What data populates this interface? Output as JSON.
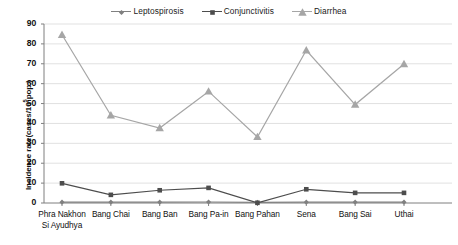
{
  "chart_data": {
    "type": "line",
    "title": "",
    "xlabel": "",
    "ylabel": "Incidence rate(cases/10⁵pop.)",
    "ylim": [
      0,
      90
    ],
    "ytick_step": 10,
    "yticks": [
      "0",
      "10",
      "20",
      "30",
      "40",
      "50",
      "60",
      "70",
      "80",
      "90"
    ],
    "grid": true,
    "legend_position": "top-center",
    "categories": [
      "Phra Nakhon Si Ayudhya",
      "Bang Chai",
      "Bang Ban",
      "Bang Pa-in",
      "Bang Pahan",
      "Sena",
      "Bang Sai",
      "Uthai"
    ],
    "category_lines": [
      [
        "Phra Nakhon",
        "Si Ayudhya"
      ],
      [
        "Bang Chai"
      ],
      [
        "Bang Ban"
      ],
      [
        "Bang Pa-in"
      ],
      [
        "Bang Pahan"
      ],
      [
        "Sena"
      ],
      [
        "Bang Sai"
      ],
      [
        "Uthai"
      ]
    ],
    "series": [
      {
        "name": "Leptospirosis",
        "marker": "diamond",
        "color": "#808080",
        "values": [
          0.4,
          0.4,
          0.4,
          0.5,
          0.3,
          0.4,
          0.4,
          0.4
        ]
      },
      {
        "name": "Conjunctivitis",
        "marker": "square",
        "color": "#4d4d4d",
        "values": [
          9.9,
          4.1,
          6.4,
          7.6,
          0.1,
          6.9,
          5.1,
          5.1
        ]
      },
      {
        "name": "Diarrhea",
        "marker": "triangle",
        "color": "#a6a6a6",
        "values": [
          84.6,
          44.1,
          37.7,
          56.1,
          33.2,
          76.8,
          49.5,
          69.9
        ]
      }
    ]
  },
  "legend": {
    "items": [
      {
        "label": "Leptospirosis"
      },
      {
        "label": "Conjunctivitis"
      },
      {
        "label": "Diarrhea"
      }
    ]
  },
  "axis": {
    "y_title_prefix": "Incidence rate(cases/10",
    "y_title_exponent": "5",
    "y_title_suffix": "pop.)"
  },
  "colors": {
    "leptospirosis": "#808080",
    "conjunctivitis": "#4d4d4d",
    "diarrhea": "#a6a6a6",
    "grid": "#d9d9d9",
    "axis": "#7f7f7f",
    "text": "#111111"
  }
}
